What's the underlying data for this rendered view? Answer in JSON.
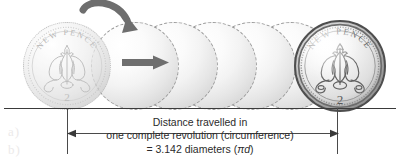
{
  "figure": {
    "coin": {
      "legend_top": "NEW PENCE",
      "denomination": "2",
      "motif": "prince-of-wales-feathers"
    },
    "caption": {
      "line1": "Distance travelled in",
      "line2": "one complete revolution (circumference)",
      "line3_prefix": "= 3.142 diameters (",
      "line3_symbol": "πd",
      "line3_suffix": ")",
      "value": "3.142",
      "formula": "πd"
    },
    "annotations": {
      "rotation_arrow": "curved-rotation-arrow",
      "travel_arrow": "straight-travel-arrow",
      "dimension": "distance-dimension-line"
    },
    "colors": {
      "arrow": "#6e6e6e",
      "ink": "#2b2b2b",
      "rule": "#3a3a3a",
      "ghost_edge": "#9a9a9a",
      "coin_rim": "#4e4e4e"
    },
    "watermarks": [
      "a)",
      "b)"
    ]
  }
}
